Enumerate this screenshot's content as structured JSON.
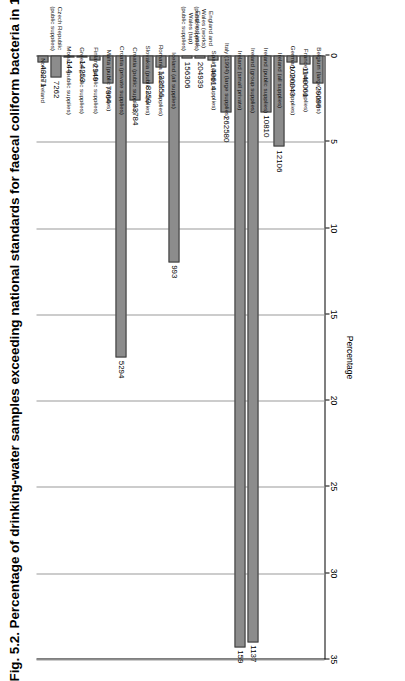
{
  "figure": {
    "title": "Fig. 5.2. Percentage of drinking-water samples exceeding national standards for faecal coliform bacteria in 1995",
    "title_superscript": "a"
  },
  "chart_data": {
    "type": "bar",
    "orientation": "horizontal",
    "title": "Fig. 5.2. Percentage of drinking-water samples exceeding national standards for faecal coliform bacteria in 1995",
    "xlabel": "Percentage",
    "ylabel": "",
    "xlim": [
      0,
      35
    ],
    "xticks": [
      "0",
      "5",
      "10",
      "15",
      "20",
      "25",
      "30",
      "35"
    ],
    "grid": true,
    "legend": "none",
    "bar_color": "#8c8c8c",
    "bar_border_color": "#3a3a3a",
    "categories": [
      "Northern Ireland",
      "Czech Republic (public supplies)",
      "Monaco (public supplies)",
      "Greece (public supplies)",
      "Finland (public supplies)",
      "Malta (public supplies)",
      "Croatia (private supplies)",
      "Croatia (public supplies)",
      "Slovakia (public supplies)",
      "Romania (public supplies)",
      "Iceland (all supplies)",
      "England and Wales (tap) (public supplies)",
      "England and Wales (works) (public supplies)",
      "Spain (large supplies)",
      "Italy (1994) (large supplies)",
      "Ireland (small private)",
      "Ireland (group supplies)",
      "Ireland (public supplies)",
      "Ireland (all supplies)",
      "Germany (large supplies)",
      "France (large supplies)",
      "Belgium (large supplies)"
    ],
    "values": [
      0.4,
      1.3,
      0.0,
      0.0,
      0.3,
      1.6,
      17.5,
      2.6,
      1.6,
      0.7,
      12.0,
      0.2,
      0.2,
      0.3,
      3.3,
      34.3,
      34.0,
      3.3,
      5.3,
      0.4,
      0.5,
      1.6
    ],
    "sample_counts": [
      "43271",
      "7262",
      "144",
      "14253",
      "2949",
      "7964",
      "5294",
      "33784",
      "8250",
      "132556",
      "993",
      "156306",
      "204939",
      "140614",
      "262580",
      "159",
      "1137",
      "10810",
      "12106",
      "1020043",
      "1140061",
      "29096"
    ]
  }
}
